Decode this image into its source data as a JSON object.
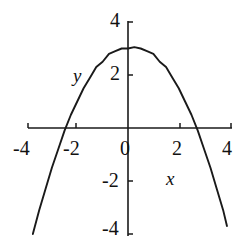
{
  "figure": {
    "background_color": "#ffffff",
    "ink_color": "#1a1a1a",
    "width": 247,
    "height": 245
  },
  "axes": {
    "x_name": "x",
    "y_name": "y",
    "x_ticks": [
      "-4",
      "-2",
      "0",
      "2",
      "4"
    ],
    "y_ticks": [
      "4",
      "2",
      "-2",
      "-4"
    ],
    "origin_label": "0"
  },
  "chart_data": {
    "type": "line",
    "title": "",
    "subtitle": "",
    "xlabel": "x",
    "ylabel": "y",
    "xlim": [
      -4,
      4
    ],
    "ylim": [
      -4,
      4
    ],
    "xticks": [
      -4,
      -2,
      0,
      2,
      4
    ],
    "yticks": [
      -4,
      -2,
      2,
      4
    ],
    "grid": false,
    "legend": null,
    "annotations": [],
    "series": [
      {
        "name": "parabola",
        "equation": "y = 3 - 0.5x^2",
        "vertex": [
          0.1,
          3.05
        ],
        "opens": "down",
        "x_intercepts": [
          -2.37,
          2.57
        ],
        "y_intercept": 3.0,
        "color": "#1a1a1a",
        "x": [
          -3.75,
          -3.5,
          -3.25,
          -3.0,
          -2.75,
          -2.5,
          -2.25,
          -2.0,
          -1.75,
          -1.5,
          -1.25,
          -1.0,
          -0.75,
          -0.5,
          -0.25,
          0.0,
          0.25,
          0.5,
          0.75,
          1.0,
          1.25,
          1.5,
          1.75,
          2.0,
          2.25,
          2.5,
          2.75,
          3.0,
          3.25,
          3.5,
          3.75,
          3.9
        ],
        "y": [
          -4.0,
          -3.1,
          -2.3,
          -1.5,
          -0.8,
          -0.1,
          0.5,
          1.0,
          1.5,
          1.9,
          2.3,
          2.5,
          2.8,
          2.9,
          3.0,
          3.0,
          3.05,
          3.0,
          2.9,
          2.8,
          2.5,
          2.3,
          1.9,
          1.5,
          1.0,
          0.5,
          -0.1,
          -0.8,
          -1.5,
          -2.3,
          -3.1,
          -3.7
        ]
      }
    ]
  }
}
